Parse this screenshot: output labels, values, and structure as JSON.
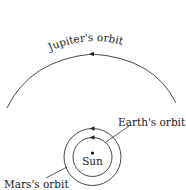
{
  "diagram": {
    "type": "orbit-diagram",
    "labels": {
      "jupiter": "Jupiter's orbit",
      "earth": "Earth's orbit",
      "mars": "Mars's orbit",
      "sun": "Sun"
    },
    "colors": {
      "line": "#333333",
      "text": "#1a1a1a",
      "background": "#ffffff"
    },
    "orbits": [
      {
        "name": "Earth",
        "direction": "counterclockwise"
      },
      {
        "name": "Mars",
        "direction": "counterclockwise"
      },
      {
        "name": "Jupiter",
        "direction": "counterclockwise"
      }
    ]
  }
}
